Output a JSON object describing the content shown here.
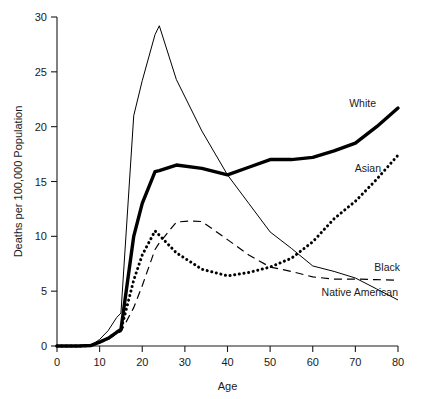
{
  "chart_data": {
    "type": "line",
    "title": "",
    "xlabel": "Age",
    "ylabel": "Deaths per 100,000 Population",
    "xlim": [
      0,
      80
    ],
    "ylim": [
      0,
      30
    ],
    "xticks": [
      0,
      10,
      20,
      30,
      40,
      50,
      60,
      70,
      80
    ],
    "yticks": [
      0,
      5,
      10,
      15,
      20,
      25,
      30
    ],
    "xtick_labels": [
      "0",
      "10",
      "20",
      "30",
      "40",
      "50",
      "60",
      "70",
      "80"
    ],
    "ytick_labels": [
      "0",
      "5",
      "10",
      "15",
      "20",
      "25",
      "30"
    ],
    "grid": false,
    "legend_position": "inline-right-end-labels",
    "series": [
      {
        "name": "White",
        "style": "thick-solid",
        "color": "#000000",
        "x": [
          0,
          5,
          8,
          10,
          12,
          14,
          15,
          18,
          20,
          23,
          24,
          28,
          34,
          40,
          45,
          50,
          55,
          60,
          65,
          70,
          75,
          80
        ],
        "y": [
          0,
          0,
          0.05,
          0.35,
          0.7,
          1.25,
          1.5,
          10.0,
          13.0,
          15.9,
          16.0,
          16.5,
          16.2,
          15.6,
          16.3,
          17.0,
          17.0,
          17.2,
          17.8,
          18.5,
          20.0,
          21.7
        ]
      },
      {
        "name": "Native American",
        "style": "thin-solid",
        "color": "#000000",
        "x": [
          0,
          5,
          8,
          10,
          12,
          14,
          15,
          18,
          20,
          23,
          24,
          28,
          34,
          40,
          45,
          50,
          55,
          60,
          65,
          70,
          75,
          80
        ],
        "y": [
          0,
          0,
          0.05,
          0.6,
          1.4,
          2.6,
          3.0,
          21.0,
          24.2,
          28.4,
          29.2,
          24.3,
          19.6,
          15.6,
          13.0,
          10.4,
          8.9,
          7.3,
          6.8,
          6.2,
          5.2,
          4.2
        ]
      },
      {
        "name": "Black",
        "style": "dashed",
        "color": "#000000",
        "x": [
          0,
          5,
          8,
          10,
          12,
          14,
          15,
          18,
          20,
          23,
          24,
          28,
          31,
          34,
          40,
          45,
          50,
          55,
          60,
          65,
          70,
          75,
          80
        ],
        "y": [
          0,
          0,
          0.05,
          0.3,
          0.6,
          1.15,
          1.3,
          3.5,
          5.5,
          8.8,
          9.4,
          11.3,
          11.4,
          11.35,
          9.7,
          8.3,
          7.2,
          6.8,
          6.3,
          6.1,
          6.1,
          6.05,
          6.0
        ]
      },
      {
        "name": "Asian",
        "style": "dotted",
        "color": "#000000",
        "x": [
          0,
          5,
          8,
          10,
          12,
          14,
          15,
          18,
          20,
          23,
          24,
          28,
          34,
          40,
          45,
          50,
          55,
          60,
          65,
          70,
          75,
          80
        ],
        "y": [
          0,
          0,
          0.05,
          0.35,
          0.7,
          1.25,
          1.45,
          6.0,
          8.3,
          10.5,
          10.1,
          8.5,
          7.0,
          6.4,
          6.7,
          7.2,
          8.0,
          9.5,
          11.6,
          13.2,
          15.2,
          17.4
        ]
      }
    ],
    "inline_labels": [
      {
        "name": "White",
        "text": "White"
      },
      {
        "name": "Asian",
        "text": "Asian"
      },
      {
        "name": "Black",
        "text": "Black"
      },
      {
        "name": "Native American",
        "text": "Native American"
      }
    ]
  }
}
